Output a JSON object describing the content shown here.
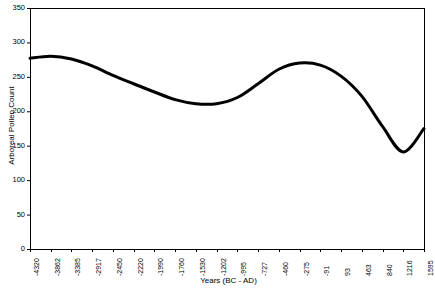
{
  "chart_data": {
    "type": "line",
    "title": "",
    "xlabel": "Years (BC - AD)",
    "ylabel": "Arboreal Pollen Count",
    "ylim": [
      0,
      350
    ],
    "ytick_labels": [
      "0",
      "50",
      "100",
      "150",
      "200",
      "250",
      "300",
      "350"
    ],
    "ytick_values": [
      0,
      50,
      100,
      150,
      200,
      250,
      300,
      350
    ],
    "grid": false,
    "legend": "none",
    "categories": [
      "-4320",
      "-3862",
      "-3385",
      "-2917",
      "-2450",
      "-2220",
      "-1990",
      "-1760",
      "-1530",
      "-1202",
      "-995",
      "-727",
      "-460",
      "-275",
      "-91",
      "93",
      "463",
      "840",
      "1216",
      "1595"
    ],
    "values": [
      277,
      280,
      276,
      266,
      252,
      240,
      228,
      217,
      211,
      211,
      220,
      240,
      261,
      270,
      267,
      251,
      222,
      178,
      141,
      175
    ],
    "series": [
      {
        "name": "Arboreal Pollen Count",
        "values": [
          277,
          280,
          276,
          266,
          252,
          240,
          228,
          217,
          211,
          211,
          220,
          240,
          261,
          270,
          267,
          251,
          222,
          178,
          141,
          175
        ]
      }
    ],
    "line_color": "#000000",
    "line_width": 3
  }
}
